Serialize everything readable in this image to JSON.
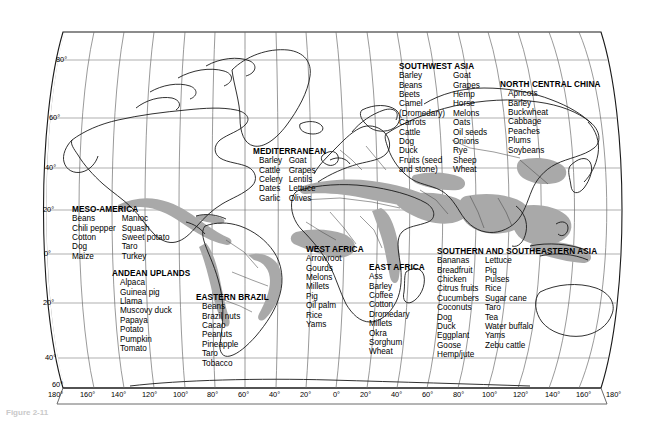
{
  "figure": {
    "caption": "Figure 2-11",
    "background": "#ffffff",
    "shade_color": "#a9a9a9",
    "line_color": "#1a1a1a"
  },
  "graticule": {
    "lat_labels": [
      "80°",
      "60°",
      "40°",
      "20°",
      "0°",
      "20°",
      "40°",
      "60°"
    ],
    "lon_labels": [
      "180°",
      "160°",
      "140°",
      "120°",
      "100°",
      "80°",
      "60°",
      "40°",
      "20°",
      "0°",
      "20°",
      "40°",
      "60°",
      "80°",
      "100°",
      "120°",
      "140°",
      "160°",
      "180°"
    ]
  },
  "hearths": [
    {
      "id": "meso-america",
      "title": "MESO-AMERICA",
      "columns": [
        [
          "Beans",
          "Chili pepper",
          "Cotton",
          "Dog",
          "Maize"
        ],
        [
          "Manioc",
          "Squash",
          "Sweet potato",
          "Taro",
          "Turkey"
        ]
      ]
    },
    {
      "id": "andean-uplands",
      "title": "ANDEAN UPLANDS",
      "columns": [
        [
          "Alpaca",
          "Guinea pig",
          "Llama",
          "Muscovy duck",
          "Papaya",
          "Potato",
          "Pumpkin",
          "Tomato"
        ]
      ]
    },
    {
      "id": "eastern-brazil",
      "title": "EASTERN BRAZIL",
      "columns": [
        [
          "Beans",
          "Brazil nuts",
          "Cacao",
          "Peanuts",
          "Pineapple",
          "Taro",
          "Tobacco"
        ]
      ]
    },
    {
      "id": "mediterranean",
      "title": "MEDITERRANEAN",
      "columns": [
        [
          "Barley",
          "Cattle",
          "Celery",
          "Dates",
          "Garlic"
        ],
        [
          "Goat",
          "Grapes",
          "Lentils",
          "Lettuce",
          "Olives"
        ]
      ]
    },
    {
      "id": "west-africa",
      "title": "WEST AFRICA",
      "columns": [
        [
          "Arrowroot",
          "Gourds",
          "Melons",
          "Millets",
          "Pig",
          "Oil palm",
          "Rice",
          "Yams"
        ]
      ]
    },
    {
      "id": "east-africa",
      "title": "EAST AFRICA",
      "columns": [
        [
          "Ass",
          "Barley",
          "Coffee",
          "Cotton",
          "Dromedary",
          "Millets",
          "Okra",
          "Sorghum",
          "Wheat"
        ]
      ]
    },
    {
      "id": "southwest-asia",
      "title": "SOUTHWEST ASIA",
      "columns": [
        [
          "Barley",
          "Beans",
          "Beets",
          "Camel",
          "  (Dromedary)",
          "Carrots",
          "Cattle",
          "Dog",
          "Duck",
          "Fruits (seed",
          "  and stone)"
        ],
        [
          "Goat",
          "Grapes",
          "Hemp",
          "Horse",
          "Melons",
          "Oats",
          "Oil seeds",
          "Onions",
          "Rye",
          "Sheep",
          "Wheat"
        ]
      ]
    },
    {
      "id": "north-central-china",
      "title": "NORTH CENTRAL CHINA",
      "columns": [
        [
          "Apricots",
          "Barley",
          "Buckwheat",
          "Cabbage",
          "Peaches",
          "Plums",
          "Soybeans"
        ]
      ]
    },
    {
      "id": "southern-southeastern-asia",
      "title": "SOUTHERN AND SOUTHEASTERN ASIA",
      "columns": [
        [
          "Bananas",
          "Breadfruit",
          "Chicken",
          "Citrus fruits",
          "Cucumbers",
          "Coconuts",
          "Dog",
          "Duck",
          "Eggplant",
          "Goose",
          "Hemp/jute"
        ],
        [
          "Lettuce",
          "Pig",
          "Pulses",
          "Rice",
          "Sugar cane",
          "Taro",
          "Tea",
          "Water buffalo",
          "Yams",
          "Zebu cattle"
        ]
      ]
    }
  ]
}
